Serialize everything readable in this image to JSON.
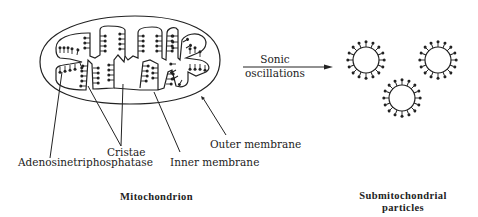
{
  "diagram": {
    "mitochondrion": {
      "caption": "Mitochondrion",
      "labels": {
        "atpase": "Adenosinetriphosphatase",
        "cristae": "Cristae",
        "inner_membrane": "Inner membrane",
        "outer_membrane": "Outer membrane"
      }
    },
    "process_arrow": {
      "line1": "Sonic",
      "line2": "oscillations"
    },
    "particles": {
      "caption_line1": "Submitochondrial",
      "caption_line2": "particles",
      "count": 3
    },
    "colors": {
      "ink": "#222222",
      "background": "#ffffff"
    }
  }
}
